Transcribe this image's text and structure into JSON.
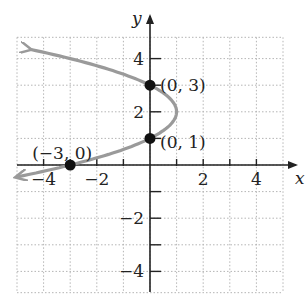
{
  "chart_data": {
    "type": "line",
    "title": "",
    "xlabel": "x",
    "ylabel": "y",
    "xlim": [
      -5,
      5
    ],
    "ylim": [
      -5,
      5
    ],
    "grid": true,
    "x_ticks": [
      -4,
      -2,
      2,
      4
    ],
    "y_ticks": [
      4,
      2,
      -2,
      -4
    ],
    "x_tick_labels": [
      "−4",
      "−2",
      "2",
      "4"
    ],
    "y_tick_labels": [
      "4",
      "2",
      "−2",
      "−4"
    ],
    "curve": {
      "description": "Parabola opening left: x = -(y-1)(y-3) shifted; vertex at (1,2)",
      "equation": "x = -(y - 2)^2 + 1",
      "vertex": [
        1,
        2
      ],
      "color": "#9a9a9a"
    },
    "points": [
      {
        "x": 0,
        "y": 3,
        "label": "(0, 3)"
      },
      {
        "x": 0,
        "y": 1,
        "label": "(0, 1)"
      },
      {
        "x": -3,
        "y": 0,
        "label": "(−3, 0)"
      }
    ]
  }
}
